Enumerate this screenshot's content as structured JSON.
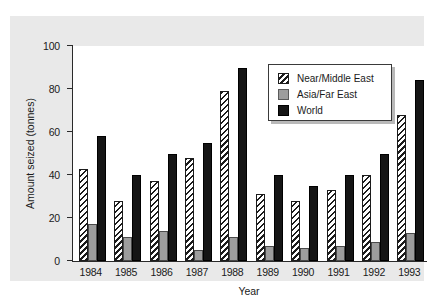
{
  "chart_data": {
    "type": "bar",
    "title": "",
    "xlabel": "Year",
    "ylabel": "Amount seized (tonnes)",
    "categories": [
      "1984",
      "1985",
      "1986",
      "1987",
      "1988",
      "1989",
      "1990",
      "1991",
      "1992",
      "1993"
    ],
    "yticks": [
      "0",
      "20",
      "40",
      "60",
      "80",
      "100"
    ],
    "ylim": [
      0,
      100
    ],
    "grid": false,
    "legend_position": "top-right",
    "series": [
      {
        "name": "Near/Middle East",
        "style": "hatched",
        "values": [
          43,
          28,
          37,
          48,
          79,
          31,
          28,
          33,
          40,
          68
        ]
      },
      {
        "name": "Asia/Far East",
        "style": "gray",
        "values": [
          17,
          11,
          14,
          5,
          11,
          7,
          6,
          7,
          9,
          13
        ]
      },
      {
        "name": "World",
        "style": "black",
        "values": [
          58,
          40,
          50,
          55,
          90,
          40,
          35,
          40,
          50,
          84
        ]
      }
    ]
  },
  "colors": {
    "panel_background": "#e9e9e9",
    "plot_background": "#ffffff",
    "axis": "#2a2a2a",
    "near_middle_east": "#ffffff",
    "asia_far_east": "#9d9d9d",
    "world": "#151515"
  }
}
